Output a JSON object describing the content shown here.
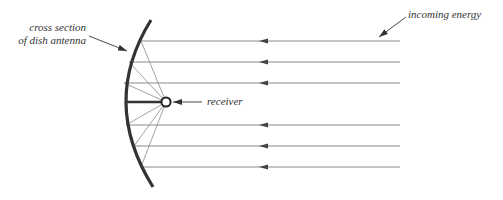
{
  "labels": {
    "dish_line1": "cross section",
    "dish_line2": "of dish antenna",
    "receiver": "receiver",
    "incoming": "incoming energy"
  },
  "colors": {
    "dish": "#333333",
    "rays": "#888888",
    "text": "#333333"
  }
}
